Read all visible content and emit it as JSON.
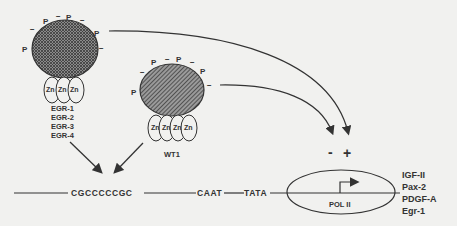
{
  "diagram": {
    "egr_protein": {
      "zinc_fingers": [
        "Zn",
        "Zn",
        "Zn"
      ],
      "labels": [
        "EGR-1",
        "EGR-2",
        "EGR-3",
        "EGR-4"
      ],
      "phospho_label": "P",
      "charge_label": "−"
    },
    "wt1_protein": {
      "zinc_fingers": [
        "Zn",
        "Zn",
        "Zn",
        "Zn"
      ],
      "label": "WT1",
      "phospho_label": "P",
      "charge_label": "−"
    },
    "promoter": {
      "gc_element": "CGCCCCCGC",
      "caat_box": "CAAT",
      "tata_box": "TATA",
      "polymerase": "POL II"
    },
    "regulation": {
      "repression_sign": "-",
      "activation_sign": "+"
    },
    "target_genes": [
      "IGF-II",
      "Pax-2",
      "PDGF-A",
      "Egr-1"
    ],
    "colors": {
      "background": "#f1f1ef",
      "ink": "#333333",
      "protein_fill": "#6a6a6a"
    }
  }
}
